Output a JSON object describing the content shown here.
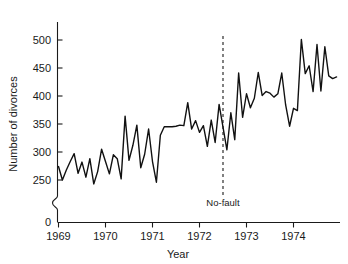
{
  "chart_data": {
    "type": "line",
    "title": "",
    "xlabel": "Year",
    "ylabel": "Number of divorces",
    "xlim": [
      1968.92,
      1975.0
    ],
    "ylim": [
      240,
      515
    ],
    "grid": false,
    "legend": "none",
    "yticks": [
      0,
      250,
      300,
      350,
      400,
      450,
      500
    ],
    "ytick_labels": [
      "0",
      "250",
      "300",
      "350",
      "400",
      "450",
      "500"
    ],
    "y_axis_break": true,
    "y_axis_break_between": [
      0,
      250
    ],
    "xticks": [
      1969,
      1970,
      1971,
      1972,
      1973,
      1974
    ],
    "xtick_labels": [
      "1969",
      "1970",
      "1971",
      "1972",
      "1973",
      "1974"
    ],
    "annotations": [
      {
        "label": "No-fault",
        "type": "vertical-dashed-line",
        "x": 1972.5,
        "label_y": 262
      }
    ],
    "series": [
      {
        "name": "Number of divorces",
        "color": "#111111",
        "x": [
          1969.0,
          1969.083,
          1969.167,
          1969.25,
          1969.333,
          1969.417,
          1969.5,
          1969.583,
          1969.667,
          1969.75,
          1969.833,
          1969.917,
          1970.0,
          1970.083,
          1970.167,
          1970.25,
          1970.333,
          1970.417,
          1970.5,
          1970.583,
          1970.667,
          1970.75,
          1970.833,
          1970.917,
          1971.0,
          1971.083,
          1971.167,
          1971.25,
          1971.333,
          1971.417,
          1971.5,
          1971.583,
          1971.667,
          1971.75,
          1971.833,
          1971.917,
          1972.0,
          1972.083,
          1972.167,
          1972.25,
          1972.333,
          1972.417,
          1972.583,
          1972.667,
          1972.75,
          1972.833,
          1972.917,
          1973.0,
          1973.083,
          1973.167,
          1973.25,
          1973.333,
          1973.417,
          1973.5,
          1973.583,
          1973.667,
          1973.75,
          1973.833,
          1973.917,
          1974.0,
          1974.083,
          1974.167,
          1974.25,
          1974.333,
          1974.417,
          1974.5,
          1974.583,
          1974.667,
          1974.75,
          1974.833,
          1974.917
        ],
        "values": [
          274,
          250,
          268,
          283,
          297,
          262,
          282,
          255,
          288,
          243,
          265,
          305,
          283,
          261,
          295,
          288,
          252,
          364,
          285,
          312,
          348,
          272,
          296,
          341,
          283,
          246,
          330,
          345,
          345,
          345,
          346,
          348,
          347,
          388,
          341,
          356,
          335,
          347,
          310,
          357,
          317,
          385,
          304,
          370,
          322,
          441,
          362,
          404,
          379,
          396,
          442,
          401,
          408,
          405,
          398,
          404,
          441,
          384,
          346,
          378,
          374,
          501,
          440,
          454,
          408,
          492,
          409,
          488,
          436,
          431,
          434
        ]
      }
    ]
  },
  "axes": {
    "y_title": "Number of divorces",
    "x_title": "Year"
  }
}
